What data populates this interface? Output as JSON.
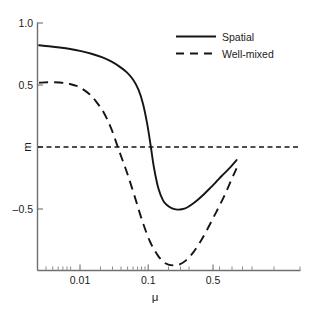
{
  "chart_data": {
    "type": "line",
    "title": "",
    "xlabel": "μ",
    "ylabel": "m",
    "xscale": "log",
    "xlim": [
      0.003,
      1.0
    ],
    "ylim": [
      -1.0,
      1.0
    ],
    "grid": false,
    "legend_position": "top-right",
    "y_ticks": [
      {
        "value": 1.0,
        "label": "1.0"
      },
      {
        "value": 0.5,
        "label": "0.5"
      },
      {
        "value": 0.0,
        "label": "m"
      },
      {
        "value": -0.5,
        "label": "–0.5"
      }
    ],
    "x_ticks": [
      {
        "value": 0.01,
        "label": "0.01"
      },
      {
        "value": 0.1,
        "label": "0.1"
      },
      {
        "value": 0.5,
        "label": "0.5"
      }
    ],
    "x_minor_ticks": [
      0.004,
      0.005,
      0.006,
      0.007,
      0.008,
      0.009,
      0.02,
      0.03,
      0.04,
      0.05,
      0.06,
      0.07,
      0.08,
      0.09,
      0.2,
      0.3,
      0.4,
      0.6,
      0.7,
      0.8,
      0.9,
      1.0
    ],
    "reference_line": {
      "value": 0.0,
      "style": "dashed",
      "orientation": "horizontal"
    },
    "series": [
      {
        "name": "Spatial",
        "style": "solid",
        "x": [
          0.003,
          0.004,
          0.0055,
          0.0075,
          0.01,
          0.014,
          0.019,
          0.025,
          0.032,
          0.04,
          0.048,
          0.056,
          0.064,
          0.072,
          0.08,
          0.088,
          0.1,
          0.115,
          0.13,
          0.15,
          0.175,
          0.2,
          0.23,
          0.27,
          0.32,
          0.38,
          0.45,
          0.55,
          0.65,
          0.8,
          1.0
        ],
        "y": [
          0.82,
          0.812,
          0.802,
          0.79,
          0.775,
          0.752,
          0.724,
          0.69,
          0.648,
          0.6,
          0.54,
          0.46,
          0.345,
          0.19,
          0.01,
          -0.165,
          -0.33,
          -0.43,
          -0.47,
          -0.495,
          -0.505,
          -0.502,
          -0.49,
          -0.462,
          -0.425,
          -0.383,
          -0.337,
          -0.28,
          -0.232,
          -0.175,
          -0.105
        ]
      },
      {
        "name": "Well-mixed",
        "style": "dashed",
        "x": [
          0.003,
          0.004,
          0.0055,
          0.007,
          0.0085,
          0.01,
          0.013,
          0.016,
          0.02,
          0.025,
          0.032,
          0.04,
          0.05,
          0.062,
          0.078,
          0.1,
          0.125,
          0.155,
          0.19,
          0.23,
          0.28,
          0.34,
          0.41,
          0.5,
          0.6,
          0.72,
          0.85,
          1.0
        ],
        "y": [
          0.518,
          0.522,
          0.52,
          0.512,
          0.498,
          0.48,
          0.43,
          0.368,
          0.28,
          0.15,
          -0.04,
          -0.21,
          -0.4,
          -0.59,
          -0.76,
          -0.88,
          -0.94,
          -0.955,
          -0.945,
          -0.91,
          -0.85,
          -0.77,
          -0.68,
          -0.575,
          -0.478,
          -0.375,
          -0.27,
          -0.172
        ]
      }
    ],
    "annotations": []
  },
  "legend": {
    "entries": [
      {
        "label": "Spatial",
        "style": "solid"
      },
      {
        "label": "Well-mixed",
        "style": "dashed"
      }
    ]
  },
  "axes": {
    "x_axis_title": "μ",
    "y_axis_title": "m"
  }
}
